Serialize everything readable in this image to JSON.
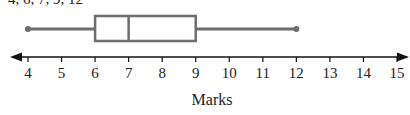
{
  "header": {
    "data_text": "4, 6, 7, 9, 12"
  },
  "chart_data": {
    "type": "boxplot",
    "title": "",
    "xlabel": "Marks",
    "ylabel": "",
    "xlim": [
      4,
      15
    ],
    "ticks": [
      4,
      5,
      6,
      7,
      8,
      9,
      10,
      11,
      12,
      13,
      14,
      15
    ],
    "tick_labels": [
      "4",
      "5",
      "6",
      "7",
      "8",
      "9",
      "10",
      "11",
      "12",
      "13",
      "14",
      "15"
    ],
    "grid": false,
    "legend": null,
    "box": {
      "min": 4,
      "q1": 6,
      "median": 7,
      "q3": 9,
      "max": 12
    },
    "colors": {
      "box": "#6e6e6e",
      "axis": "#111111"
    }
  }
}
